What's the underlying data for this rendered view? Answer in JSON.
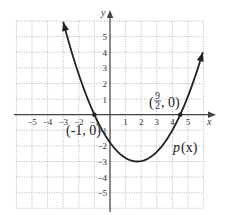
{
  "chart_data": {
    "type": "line",
    "title": "",
    "xlabel": "x",
    "ylabel": "y",
    "xlim": [
      -6,
      6
    ],
    "ylim": [
      -6,
      6
    ],
    "grid": true,
    "grid_style": "dotted",
    "x_ticks": [
      -5,
      -4,
      -3,
      -2,
      -1,
      1,
      2,
      3,
      4,
      5
    ],
    "y_ticks": [
      -5,
      -4,
      -3,
      -2,
      -1,
      1,
      2,
      3,
      4,
      5
    ],
    "x_tick_labels": [
      "−5",
      "−4",
      "−3",
      "−2",
      "−1",
      "1",
      "2",
      "3",
      "4",
      "5"
    ],
    "y_tick_labels": [
      "−5",
      "−4",
      "−3",
      "−2",
      "−1",
      "1",
      "2",
      "3",
      "4",
      "5"
    ],
    "series": [
      {
        "name": "p(x)",
        "kind": "parabola",
        "roots": [
          -1,
          4.5
        ],
        "vertex": [
          1.75,
          -3
        ],
        "x_range": [
          -3,
          5.95
        ],
        "points": [
          [
            -3,
            6
          ],
          [
            -2,
            2.6
          ],
          [
            -1,
            0
          ],
          [
            0,
            -1.8
          ],
          [
            1,
            -2.8
          ],
          [
            1.75,
            -3
          ],
          [
            2,
            -2.98
          ],
          [
            3,
            -2.38
          ],
          [
            4,
            -0.99
          ],
          [
            4.5,
            0
          ],
          [
            5,
            1.19
          ],
          [
            5.95,
            3.9
          ]
        ],
        "arrows_at_ends": true
      }
    ],
    "annotations": [
      {
        "text": "(-1, 0)",
        "point": [
          -1,
          0
        ]
      },
      {
        "text": "(9/2, 0)",
        "numerator": "9",
        "denominator": "2",
        "point": [
          4.5,
          0
        ]
      },
      {
        "text": "p(x)",
        "label_for": "p(x)"
      }
    ]
  },
  "labels": {
    "x_axis": "x",
    "y_axis": "y",
    "root_left": "(-1, 0)",
    "root_right_open": "(",
    "root_right_num": "9",
    "root_right_den": "2",
    "root_right_close": ", 0)",
    "function_name": "p",
    "function_arg": "(x)"
  }
}
